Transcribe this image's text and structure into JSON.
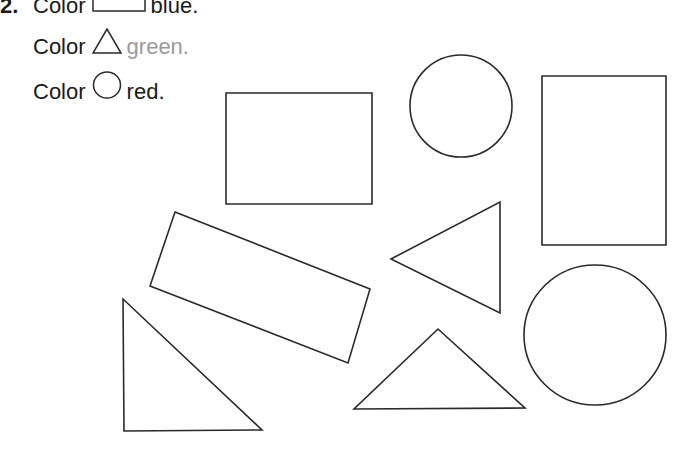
{
  "worksheet": {
    "item_number": "2.",
    "instructions": [
      {
        "prefix": "Color",
        "shape_icon": "rectangle-icon",
        "color_word": "blue.",
        "color_word_hex": "#1a1a1a"
      },
      {
        "prefix": "Color",
        "shape_icon": "triangle-icon",
        "color_word": "green.",
        "color_word_hex": "#9a9a9a"
      },
      {
        "prefix": "Color",
        "shape_icon": "circle-icon",
        "color_word": "red.",
        "color_word_hex": "#1a1a1a"
      }
    ]
  },
  "shapes": [
    {
      "type": "rectangle",
      "points": "226,93 372,93 372,204 226,204"
    },
    {
      "type": "circle",
      "cx": 461,
      "cy": 106,
      "rx": 51,
      "ry": 51
    },
    {
      "type": "rectangle",
      "points": "542,76 666,76 666,245 542,245"
    },
    {
      "type": "rectangle-rotated",
      "points": "175,212 370,289 348,363 150,286"
    },
    {
      "type": "triangle",
      "points": "391,259 500,202 500,313"
    },
    {
      "type": "circle",
      "cx": 595,
      "cy": 335,
      "rx": 71,
      "ry": 70
    },
    {
      "type": "triangle",
      "points": "123,299 124,431 262,430"
    },
    {
      "type": "triangle",
      "points": "438,329 354,409 525,408"
    }
  ]
}
